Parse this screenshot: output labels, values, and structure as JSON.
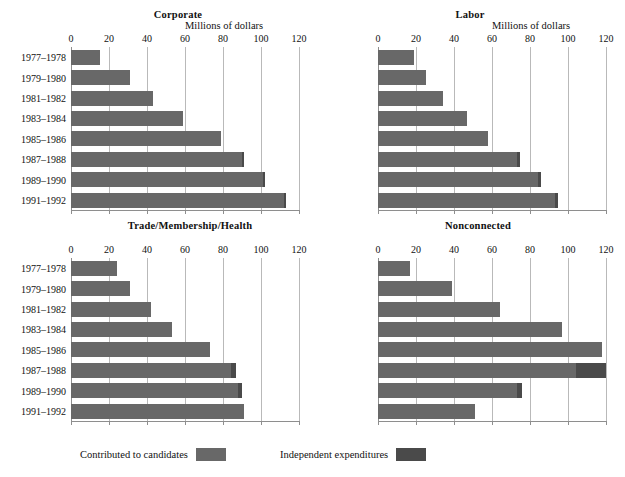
{
  "figure": {
    "unit_label": "Millions of dollars",
    "colors": {
      "contributed": "#686868",
      "independent": "#4a4a4a",
      "gridline": "#b9b9b9",
      "axis": "#8e8e8e",
      "background": "#ffffff",
      "text": "#111111"
    }
  },
  "legend": {
    "items": [
      {
        "label": "Contributed to candidates",
        "color": "#686868",
        "key": "contributed"
      },
      {
        "label": "Independent expenditures",
        "color": "#4a4a4a",
        "key": "independent"
      }
    ]
  },
  "chart_data": {
    "type": "bar",
    "orientation": "horizontal",
    "stacked": true,
    "title": "",
    "xlabel": "Millions of dollars",
    "ylabel": "",
    "xlim": [
      0,
      120
    ],
    "xticks": [
      0,
      20,
      40,
      60,
      80,
      100,
      120
    ],
    "tick_labels": [
      "0",
      "20",
      "40",
      "60",
      "80",
      "100",
      "120"
    ],
    "grid": true,
    "legend_position": "bottom",
    "categories": [
      "1977–1978",
      "1979–1980",
      "1981–1982",
      "1983–1984",
      "1985–1986",
      "1987–1988",
      "1989–1990",
      "1991–1992"
    ],
    "series_names": [
      "Contributed to candidates",
      "Independent expenditures"
    ],
    "panels": [
      {
        "title": "Corporate",
        "position": "top-left",
        "show_row_labels": true,
        "show_unit_label": true,
        "series": [
          {
            "name": "Contributed to candidates",
            "values": [
              15,
              31,
              43,
              59,
              79,
              90,
              101,
              112
            ]
          },
          {
            "name": "Independent expenditures",
            "values": [
              0,
              0,
              0,
              0,
              0,
              1,
              1,
              1
            ]
          }
        ],
        "totals": [
          15,
          31,
          43,
          59,
          79,
          91,
          102,
          113
        ]
      },
      {
        "title": "Labor",
        "position": "top-right",
        "show_row_labels": false,
        "show_unit_label": true,
        "series": [
          {
            "name": "Contributed to candidates",
            "values": [
              19,
              25,
              34,
              47,
              58,
              73,
              84,
              93
            ]
          },
          {
            "name": "Independent expenditures",
            "values": [
              0,
              0,
              0,
              0,
              0,
              2,
              2,
              2
            ]
          }
        ],
        "totals": [
          19,
          25,
          34,
          47,
          58,
          75,
          86,
          95
        ]
      },
      {
        "title": "Trade/Membership/Health",
        "position": "bottom-left",
        "show_row_labels": true,
        "show_unit_label": false,
        "series": [
          {
            "name": "Contributed to candidates",
            "values": [
              24,
              31,
              42,
              53,
              73,
              84,
              88,
              91
            ]
          },
          {
            "name": "Independent expenditures",
            "values": [
              0,
              0,
              0,
              0,
              0,
              3,
              2,
              0
            ]
          }
        ],
        "totals": [
          24,
          31,
          42,
          53,
          73,
          87,
          90,
          91
        ]
      },
      {
        "title": "Nonconnected",
        "position": "bottom-right",
        "show_row_labels": false,
        "show_unit_label": false,
        "series": [
          {
            "name": "Contributed to candidates",
            "values": [
              17,
              39,
              64,
              97,
              118,
              104,
              73,
              51
            ]
          },
          {
            "name": "Independent expenditures",
            "values": [
              0,
              0,
              0,
              0,
              0,
              16,
              3,
              0
            ]
          }
        ],
        "totals": [
          17,
          39,
          64,
          97,
          118,
          120,
          76,
          51
        ]
      }
    ]
  }
}
